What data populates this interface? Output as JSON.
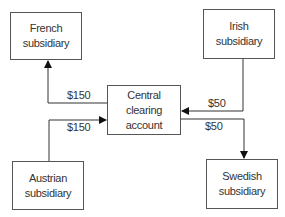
{
  "diagram": {
    "nodes": {
      "french": {
        "line1": "French",
        "line2": "subsidiary"
      },
      "irish": {
        "line1": "Irish",
        "line2": "subsidiary"
      },
      "central": {
        "line1": "Central",
        "line2": "clearing",
        "line3": "account"
      },
      "austrian": {
        "line1": "Austrian",
        "line2": "subsidiary"
      },
      "swedish": {
        "line1": "Swedish",
        "line2": "subsidiary"
      }
    },
    "edges": {
      "central_to_french": {
        "amount": "$150"
      },
      "austrian_to_central": {
        "amount": "$150"
      },
      "irish_to_central": {
        "amount": "$50"
      },
      "central_to_swedish": {
        "amount": "$50"
      }
    }
  }
}
